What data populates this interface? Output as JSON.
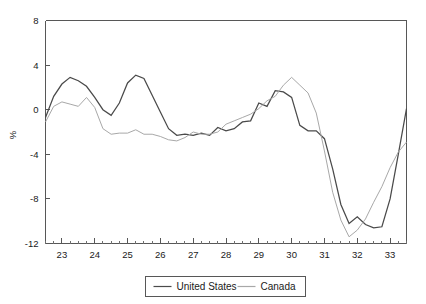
{
  "chart_data": {
    "type": "line",
    "title": "",
    "subtitle": "",
    "xlabel": "",
    "ylabel": "%",
    "xlim": [
      22.5,
      33.5
    ],
    "ylim": [
      -12,
      8
    ],
    "yticks": [
      8,
      4,
      0,
      -4,
      -8,
      -12
    ],
    "yticklabels": [
      "8",
      "4",
      "0",
      "-4",
      "-8",
      "-12"
    ],
    "xticks": [
      23,
      24,
      25,
      26,
      27,
      28,
      29,
      30,
      31,
      32,
      33
    ],
    "xticklabels": [
      "23",
      "24",
      "25",
      "26",
      "27",
      "28",
      "29",
      "30",
      "31",
      "32",
      "33"
    ],
    "x_minor_interval": 0.25,
    "grid": false,
    "legend_position": "below-center",
    "x": [
      22.5,
      22.75,
      23.0,
      23.25,
      23.5,
      23.75,
      24.0,
      24.25,
      24.5,
      24.75,
      25.0,
      25.25,
      25.5,
      25.75,
      26.0,
      26.25,
      26.5,
      26.75,
      27.0,
      27.25,
      27.5,
      27.75,
      28.0,
      28.25,
      28.5,
      28.75,
      29.0,
      29.25,
      29.5,
      29.75,
      30.0,
      30.25,
      30.5,
      30.75,
      31.0,
      31.25,
      31.5,
      31.75,
      32.0,
      32.25,
      32.5,
      32.75,
      33.0,
      33.25,
      33.5
    ],
    "series": [
      {
        "name": "United States",
        "color": "#4a4a4a",
        "values": [
          -0.7,
          1.2,
          2.3,
          2.9,
          2.6,
          2.1,
          1.1,
          0.0,
          -0.5,
          0.6,
          2.4,
          3.1,
          2.8,
          1.3,
          -0.2,
          -1.7,
          -2.3,
          -2.2,
          -2.3,
          -2.1,
          -2.3,
          -1.6,
          -1.9,
          -1.7,
          -1.1,
          -1.0,
          0.6,
          0.3,
          1.7,
          1.6,
          1.1,
          -1.4,
          -1.9,
          -1.9,
          -2.6,
          -5.3,
          -8.5,
          -10.2,
          -9.6,
          -10.3,
          -10.6,
          -10.5,
          -8.0,
          -4.0,
          0.1
        ]
      },
      {
        "name": "Canada",
        "color": "#a8a8a8",
        "values": [
          -1.1,
          0.3,
          0.7,
          0.5,
          0.3,
          1.1,
          0.2,
          -1.7,
          -2.2,
          -2.1,
          -2.1,
          -1.8,
          -2.2,
          -2.2,
          -2.4,
          -2.7,
          -2.8,
          -2.5,
          -2.0,
          -2.2,
          -2.2,
          -2.0,
          -1.3,
          -1.0,
          -0.7,
          -0.4,
          0.1,
          0.8,
          1.2,
          2.2,
          2.9,
          2.2,
          1.5,
          -0.3,
          -3.7,
          -7.4,
          -9.9,
          -11.4,
          -10.8,
          -9.8,
          -8.3,
          -6.9,
          -5.2,
          -3.8,
          -2.9
        ]
      }
    ],
    "annotations": []
  },
  "legend": {
    "items": [
      {
        "label": "United States",
        "color": "#4a4a4a"
      },
      {
        "label": "Canada",
        "color": "#a8a8a8"
      }
    ]
  },
  "axis": {
    "y_title": "%"
  }
}
